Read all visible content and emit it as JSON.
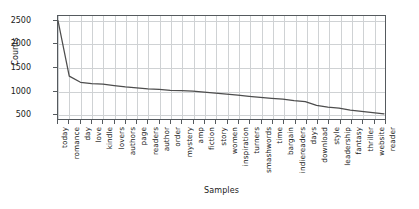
{
  "chart_data": {
    "type": "line",
    "title": "",
    "xlabel": "Samples",
    "ylabel": "Counts",
    "ylim": [
      380,
      2600
    ],
    "yticks": [
      500,
      1000,
      1500,
      2000,
      2500
    ],
    "grid": true,
    "legend": null,
    "line_color": "#4d4d4d",
    "categories": [
      "today",
      "romance",
      "day",
      "love",
      "kindle",
      "lovers",
      "authors",
      "page",
      "readers",
      "author",
      "order",
      "mystery",
      "amp",
      "fiction",
      "story",
      "women",
      "inspiration",
      "turners",
      "smashwords",
      "time",
      "bargain",
      "indiereaders",
      "days",
      "download",
      "style",
      "leadership",
      "fantasy",
      "thriller",
      "website",
      "reader"
    ],
    "values": [
      2500,
      1320,
      1190,
      1160,
      1150,
      1120,
      1090,
      1070,
      1050,
      1040,
      1020,
      1010,
      1000,
      980,
      960,
      940,
      915,
      890,
      870,
      850,
      830,
      800,
      780,
      700,
      660,
      640,
      600,
      570,
      545,
      520
    ]
  }
}
